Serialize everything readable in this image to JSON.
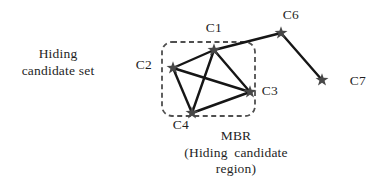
{
  "colors": {
    "background": "#ffffff",
    "edge": "#161616",
    "star": "#474747",
    "mbr_border": "#4f4f4f",
    "text": "#1f1f1f"
  },
  "side_label": {
    "line1": "Hiding",
    "line2": "candidate set"
  },
  "mbr_caption": {
    "title": "MBR",
    "line1": "(Hiding candidate",
    "line2": "region)"
  },
  "diagram": {
    "mbr_box": {
      "x": 162,
      "y": 42,
      "w": 93,
      "h": 74,
      "rx": 10
    },
    "star_outer_radius": 6.8,
    "star_inner_radius": 2.7,
    "edge_width": 2.4,
    "nodes": [
      {
        "id": "C1",
        "label": "C1",
        "x": 214,
        "y": 50,
        "label_x": 214,
        "label_y": 28
      },
      {
        "id": "C2",
        "label": "C2",
        "x": 173,
        "y": 68,
        "label_x": 144,
        "label_y": 65
      },
      {
        "id": "C3",
        "label": "C3",
        "x": 250,
        "y": 92,
        "label_x": 270,
        "label_y": 91
      },
      {
        "id": "C4",
        "label": "C4",
        "x": 192,
        "y": 113,
        "label_x": 181,
        "label_y": 125
      },
      {
        "id": "C6",
        "label": "C6",
        "x": 281,
        "y": 33,
        "label_x": 291,
        "label_y": 15
      },
      {
        "id": "C7",
        "label": "C7",
        "x": 322,
        "y": 80,
        "label_x": 358,
        "label_y": 81
      }
    ],
    "edges": [
      [
        "C2",
        "C1"
      ],
      [
        "C1",
        "C6"
      ],
      [
        "C1",
        "C3"
      ],
      [
        "C1",
        "C4"
      ],
      [
        "C2",
        "C3"
      ],
      [
        "C2",
        "C4"
      ],
      [
        "C3",
        "C4"
      ],
      [
        "C6",
        "C7"
      ]
    ]
  }
}
